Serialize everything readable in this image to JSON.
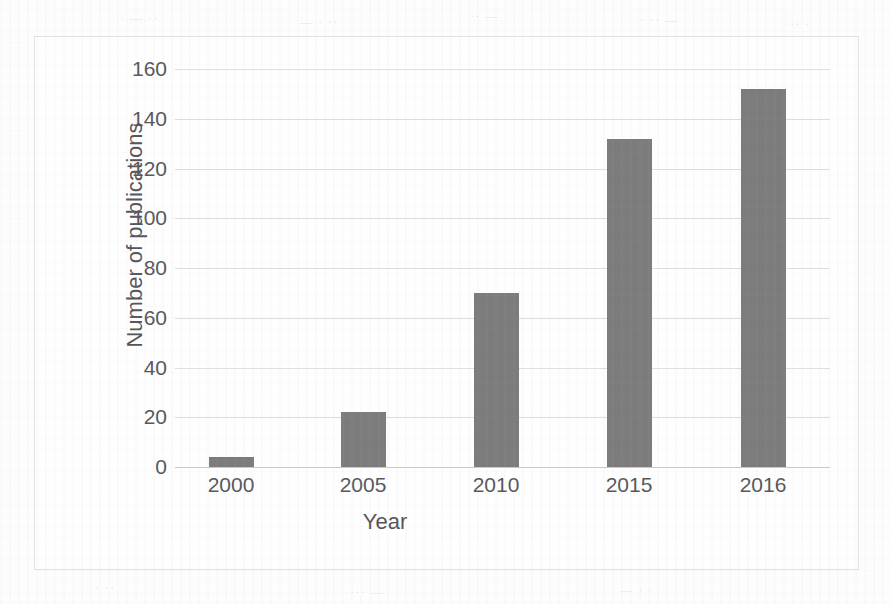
{
  "chart_data": {
    "type": "bar",
    "title": "",
    "xlabel": "Year",
    "ylabel": "Number of publications",
    "categories": [
      "2000",
      "2005",
      "2010",
      "2015",
      "2016"
    ],
    "values": [
      4,
      22,
      70,
      132,
      152
    ],
    "ylim": [
      0,
      160
    ],
    "yticks": [
      0,
      20,
      40,
      60,
      80,
      100,
      120,
      140,
      160
    ],
    "ytick_labels": [
      "0",
      "20",
      "40",
      "60",
      "80",
      "100",
      "120",
      "140",
      "160"
    ],
    "grid": true,
    "legend": "none",
    "bar_color": "#7c7c7c",
    "gridline_color": "#dedee0",
    "frame_border_color": "#e2e2e4",
    "background_color": "#fefefe",
    "text_color": "#58585c"
  },
  "ghost_marks": [
    {
      "text": "· — ··",
      "left": 120,
      "top": 10
    },
    {
      "text": "— · ··",
      "left": 300,
      "top": 14
    },
    {
      "text": "·· —",
      "left": 470,
      "top": 8
    },
    {
      "text": "· ·· —",
      "left": 640,
      "top": 12
    },
    {
      "text": "·· ·",
      "left": 790,
      "top": 16
    },
    {
      "text": "— ···",
      "left": 60,
      "top": 430
    },
    {
      "text": "·· — ·",
      "left": 560,
      "top": 452
    },
    {
      "text": "· ··",
      "left": 95,
      "top": 580
    },
    {
      "text": "··· —",
      "left": 350,
      "top": 584
    },
    {
      "text": "— · ·",
      "left": 620,
      "top": 582
    }
  ]
}
